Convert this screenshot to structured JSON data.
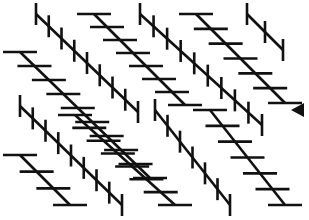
{
  "figure": {
    "stroke_color": "#111111",
    "background": "#ffffff",
    "tick_length_vertical": 22,
    "tick_length_horizontal": 34,
    "diagonals": [
      {
        "x1": 36,
        "y1": 14,
        "x2": 138,
        "y2": 112,
        "tick": "vertical",
        "spacing": 12.5
      },
      {
        "x1": 94,
        "y1": 14,
        "x2": 185,
        "y2": 105,
        "tick": "horizontal",
        "spacing": 13
      },
      {
        "x1": 140,
        "y1": 14,
        "x2": 262,
        "y2": 125,
        "tick": "vertical",
        "spacing": 12.5
      },
      {
        "x1": 196,
        "y1": 14,
        "x2": 285,
        "y2": 103,
        "tick": "horizontal",
        "spacing": 13
      },
      {
        "x1": 247,
        "y1": 14,
        "x2": 283,
        "y2": 50,
        "tick": "vertical",
        "spacing": 12.5
      },
      {
        "x1": 20,
        "y1": 52,
        "x2": 150,
        "y2": 178,
        "tick": "horizontal",
        "spacing": 13
      },
      {
        "x1": 20,
        "y1": 106,
        "x2": 122,
        "y2": 205,
        "tick": "vertical",
        "spacing": 12.5
      },
      {
        "x1": 75,
        "y1": 115,
        "x2": 175,
        "y2": 205,
        "tick": "horizontal",
        "spacing": 13
      },
      {
        "x1": 155,
        "y1": 110,
        "x2": 230,
        "y2": 205,
        "tick": "vertical",
        "spacing": 12.5
      },
      {
        "x1": 210,
        "y1": 110,
        "x2": 285,
        "y2": 205,
        "tick": "horizontal",
        "spacing": 13
      },
      {
        "x1": 20,
        "y1": 155,
        "x2": 70,
        "y2": 205,
        "tick": "horizontal",
        "spacing": 13
      },
      {
        "x1": 150,
        "y1": 14,
        "x2": 240,
        "y2": 205,
        "tick": "none",
        "spacing": 0
      }
    ],
    "marker": {
      "type": "triangle-left",
      "points": "291,110 304,103 304,117",
      "color": "#111111"
    }
  }
}
